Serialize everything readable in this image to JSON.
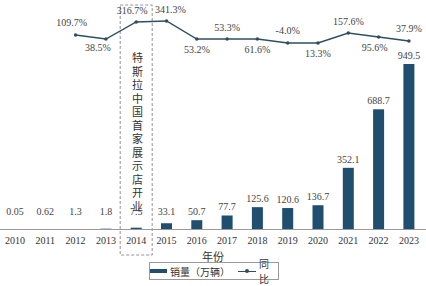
{
  "chart_data": {
    "type": "bar+line",
    "title": "",
    "xlabel": "年份",
    "ylabel": "",
    "categories": [
      "2010",
      "2011",
      "2012",
      "2013",
      "2014",
      "2015",
      "2016",
      "2017",
      "2018",
      "2019",
      "2020",
      "2021",
      "2022",
      "2023"
    ],
    "series": [
      {
        "name": "销量（万辆）",
        "type": "bar",
        "values": [
          0.05,
          0.62,
          1.3,
          1.8,
          7.5,
          33.1,
          50.7,
          77.7,
          125.6,
          120.6,
          136.7,
          352.1,
          688.7,
          949.5
        ],
        "labels": [
          "0.05",
          "0.62",
          "1.3",
          "1.8",
          "7.5",
          "33.1",
          "50.7",
          "77.7",
          "125.6",
          "120.6",
          "136.7",
          "352.1",
          "688.7",
          "949.5"
        ]
      },
      {
        "name": "同比",
        "type": "line",
        "values": [
          null,
          null,
          109.7,
          38.5,
          316.7,
          341.3,
          53.2,
          53.3,
          61.6,
          -4.0,
          13.3,
          157.6,
          95.6,
          37.9
        ],
        "labels": [
          null,
          null,
          "109.7%",
          "38.5%",
          "316.7%",
          "341.3%",
          "53.2%",
          "53.3%",
          "61.6%",
          "-4.0%",
          "13.3%",
          "157.6%",
          "95.6%",
          "37.9%"
        ]
      }
    ],
    "annotation": {
      "category": "2014",
      "text": "特斯拉中国首家展示店开业",
      "style": "dashed-box"
    },
    "legend": {
      "position": "bottom",
      "entries": [
        "销量（万辆）",
        "同比"
      ]
    },
    "grid": false,
    "colors": {
      "bar": "#1f4e6e",
      "line": "#2f4f5f"
    }
  },
  "axis": {
    "xlabel": "年份"
  },
  "legend": {
    "bar_label": "销量（万辆）",
    "line_label": "同比"
  }
}
